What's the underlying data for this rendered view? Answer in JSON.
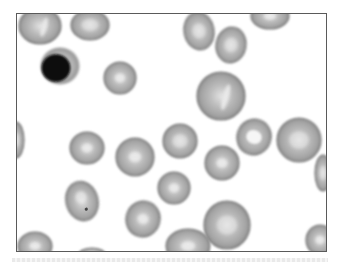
{
  "image": {
    "subject": "Peripheral blood smear micrograph",
    "colors": {
      "background": "#ffffff",
      "frame": "#555555",
      "rbc_edge": "#7a7a7a",
      "rbc_fill": "#b4b4b4",
      "rbc_pallor": "#ececec",
      "nucleus": "#0a0a0a",
      "cytoplasm": "#c8c8c8"
    },
    "cells": [
      {
        "type": "rbc",
        "cx": 40,
        "cy": 26,
        "rx": 21,
        "ry": 18,
        "rot": 0,
        "pallor": "streak"
      },
      {
        "type": "rbc",
        "cx": 90,
        "cy": 25,
        "rx": 19,
        "ry": 15,
        "rot": 0,
        "pallor": "soft"
      },
      {
        "type": "lymphocyte",
        "cx": 60,
        "cy": 66,
        "rx": 20,
        "ry": 19,
        "rot": 0
      },
      {
        "type": "rbc",
        "cx": 120,
        "cy": 78,
        "rx": 16,
        "ry": 16,
        "rot": 0,
        "pallor": "center"
      },
      {
        "type": "rbc",
        "cx": 199,
        "cy": 31,
        "rx": 15,
        "ry": 19,
        "rot": -10,
        "pallor": "soft"
      },
      {
        "type": "rbc",
        "cx": 231,
        "cy": 45,
        "rx": 15,
        "ry": 18,
        "rot": 10,
        "pallor": "soft"
      },
      {
        "type": "rbc",
        "cx": 270,
        "cy": 16,
        "rx": 19,
        "ry": 13,
        "rot": 0,
        "pallor": "center"
      },
      {
        "type": "rbc",
        "cx": 221,
        "cy": 96,
        "rx": 24,
        "ry": 24,
        "rot": 0,
        "pallor": "streak"
      },
      {
        "type": "rbc",
        "cx": 16,
        "cy": 140,
        "rx": 8,
        "ry": 18,
        "rot": 0,
        "pallor": "soft"
      },
      {
        "type": "rbc",
        "cx": 87,
        "cy": 148,
        "rx": 17,
        "ry": 16,
        "rot": 0,
        "pallor": "center"
      },
      {
        "type": "rbc",
        "cx": 135,
        "cy": 157,
        "rx": 19,
        "ry": 19,
        "rot": 0,
        "pallor": "center"
      },
      {
        "type": "rbc",
        "cx": 180,
        "cy": 141,
        "rx": 17,
        "ry": 17,
        "rot": 0,
        "pallor": "soft"
      },
      {
        "type": "rbc",
        "cx": 222,
        "cy": 163,
        "rx": 17,
        "ry": 17,
        "rot": 0,
        "pallor": "center"
      },
      {
        "type": "rbc",
        "cx": 254,
        "cy": 137,
        "rx": 17,
        "ry": 18,
        "rot": 20,
        "pallor": "ring"
      },
      {
        "type": "rbc",
        "cx": 299,
        "cy": 140,
        "rx": 22,
        "ry": 22,
        "rot": 0,
        "pallor": "soft"
      },
      {
        "type": "rbc",
        "cx": 323,
        "cy": 173,
        "rx": 8,
        "ry": 18,
        "rot": 0,
        "pallor": "soft"
      },
      {
        "type": "rbc",
        "cx": 82,
        "cy": 201,
        "rx": 16,
        "ry": 20,
        "rot": -15,
        "pallor": "dot"
      },
      {
        "type": "rbc",
        "cx": 174,
        "cy": 188,
        "rx": 16,
        "ry": 16,
        "rot": 0,
        "pallor": "center"
      },
      {
        "type": "rbc",
        "cx": 143,
        "cy": 219,
        "rx": 17,
        "ry": 18,
        "rot": 15,
        "pallor": "center"
      },
      {
        "type": "rbc",
        "cx": 227,
        "cy": 225,
        "rx": 23,
        "ry": 24,
        "rot": 0,
        "pallor": "soft"
      },
      {
        "type": "rbc",
        "cx": 188,
        "cy": 246,
        "rx": 22,
        "ry": 17,
        "rot": 0,
        "pallor": "center"
      },
      {
        "type": "rbc",
        "cx": 35,
        "cy": 246,
        "rx": 17,
        "ry": 14,
        "rot": 0,
        "pallor": "center"
      },
      {
        "type": "rbc",
        "cx": 92,
        "cy": 254,
        "rx": 13,
        "ry": 6,
        "rot": 0,
        "pallor": "soft"
      },
      {
        "type": "rbc",
        "cx": 320,
        "cy": 240,
        "rx": 14,
        "ry": 15,
        "rot": 0,
        "pallor": "center"
      }
    ]
  }
}
